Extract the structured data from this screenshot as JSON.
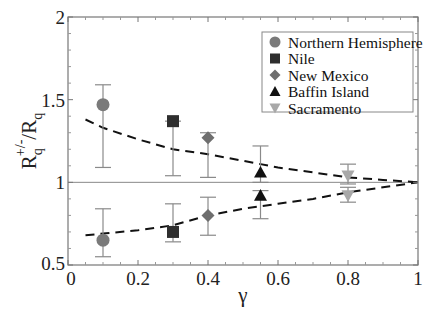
{
  "chart_data": {
    "type": "scatter",
    "title": "",
    "xlabel": "γ",
    "ylabel_main": "R",
    "ylabel_sub": "q",
    "ylabel_sup": "+/-",
    "ylabel_tail": "/R",
    "ylabel_tail_sub": "q",
    "xlim": [
      0,
      1
    ],
    "ylim": [
      0.5,
      2
    ],
    "x_ticks": [
      0,
      0.2,
      0.4,
      0.6,
      0.8,
      1
    ],
    "x_tick_labels": [
      "0",
      "0.2",
      "0.4",
      "0.6",
      "0.8",
      "1"
    ],
    "y_ticks": [
      0.5,
      1,
      1.5,
      2
    ],
    "y_tick_labels": [
      "0.5",
      "1",
      "1.5",
      "2"
    ],
    "reference_line_y": 1,
    "legend_position": "top-right",
    "series": [
      {
        "name": "Northern Hemisphere",
        "marker": "circle",
        "color": "#7a7a7a",
        "points": [
          {
            "x": 0.1,
            "y": 1.47,
            "err_low": 1.09,
            "err_high": 1.59
          },
          {
            "x": 0.1,
            "y": 0.65,
            "err_low": 0.55,
            "err_high": 0.84
          }
        ]
      },
      {
        "name": "Nile",
        "marker": "square",
        "color": "#2e2e2e",
        "points": [
          {
            "x": 0.3,
            "y": 1.37,
            "err_low": 1.04,
            "err_high": 1.37
          },
          {
            "x": 0.3,
            "y": 0.7,
            "err_low": 0.64,
            "err_high": 0.87
          }
        ]
      },
      {
        "name": "New Mexico",
        "marker": "diamond",
        "color": "#6e6e6e",
        "points": [
          {
            "x": 0.4,
            "y": 1.27,
            "err_low": 1.03,
            "err_high": 1.3
          },
          {
            "x": 0.4,
            "y": 0.8,
            "err_low": 0.68,
            "err_high": 0.91
          }
        ]
      },
      {
        "name": "Baffin Island",
        "marker": "triangle-up",
        "color": "#111111",
        "points": [
          {
            "x": 0.55,
            "y": 1.06,
            "err_low": 1.0,
            "err_high": 1.22
          },
          {
            "x": 0.55,
            "y": 0.92,
            "err_low": 0.78,
            "err_high": 0.95
          }
        ]
      },
      {
        "name": "Sacramento",
        "marker": "triangle-down",
        "color": "#a8a8a8",
        "points": [
          {
            "x": 0.8,
            "y": 1.04,
            "err_low": 0.99,
            "err_high": 1.11
          },
          {
            "x": 0.8,
            "y": 0.92,
            "err_low": 0.88,
            "err_high": 0.97
          }
        ]
      }
    ],
    "curves": [
      {
        "name": "model-upper",
        "style": "dashed",
        "x": [
          0.05,
          0.1,
          0.2,
          0.3,
          0.4,
          0.5,
          0.6,
          0.7,
          0.8,
          0.9,
          1.0
        ],
        "y": [
          1.38,
          1.33,
          1.26,
          1.2,
          1.17,
          1.13,
          1.09,
          1.06,
          1.03,
          1.015,
          1.0
        ]
      },
      {
        "name": "model-lower",
        "style": "dashed",
        "x": [
          0.05,
          0.1,
          0.2,
          0.3,
          0.4,
          0.5,
          0.6,
          0.7,
          0.8,
          0.9,
          1.0
        ],
        "y": [
          0.68,
          0.69,
          0.71,
          0.74,
          0.8,
          0.84,
          0.87,
          0.9,
          0.94,
          0.97,
          1.0
        ]
      }
    ]
  }
}
